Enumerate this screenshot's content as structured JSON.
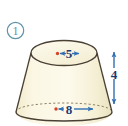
{
  "figure": {
    "problem_number": "1",
    "shape_name": "truncated-cone-frustum",
    "labels": {
      "top_diameter": "5",
      "bottom_diameter": "8",
      "height": "4"
    },
    "colors": {
      "body_fill": "#f7f2d8",
      "body_fill_light": "#fdfbee",
      "outline": "#4a4034",
      "dashed_outline": "#8c8268",
      "arrow_blue": "#2f6fb5",
      "label_navy": "#1b3a70",
      "center_dot_red": "#d4452a",
      "problem_circle": "#5f93a8",
      "background": "#ffffff"
    }
  }
}
